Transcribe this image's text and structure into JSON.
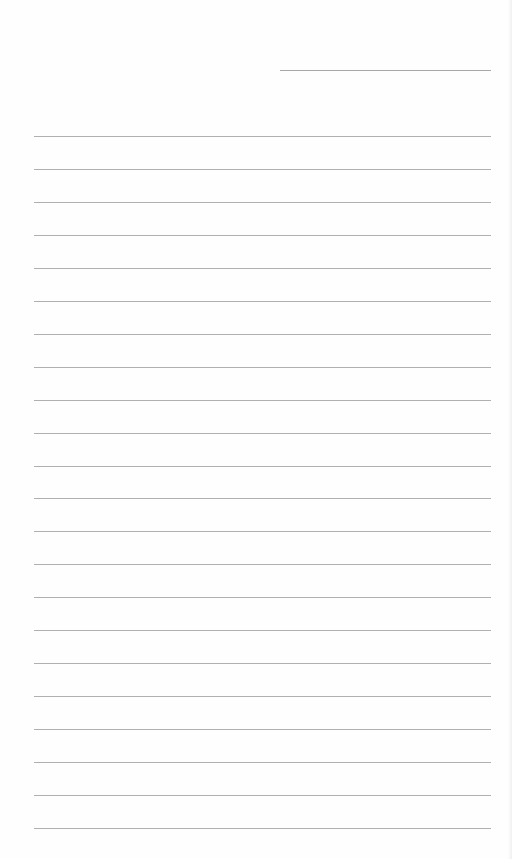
{
  "page": {
    "type": "lined-paper",
    "background_color": "#fefefe",
    "line_color": "#b0b0b0",
    "header_line": {
      "x": 280,
      "y": 70,
      "width": 211
    },
    "rules": {
      "x": 34,
      "width": 457,
      "first_y": 136,
      "spacing": 32.95,
      "count": 22
    }
  }
}
